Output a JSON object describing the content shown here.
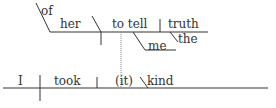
{
  "diagram": {
    "type": "sentence-diagram",
    "sentence": "I took (it) kind of her to tell me the truth",
    "line_color": "#333333",
    "main_clause": {
      "subject": "I",
      "verb": "took",
      "object": "(it)",
      "complement": "kind"
    },
    "modifier_phrase": {
      "preposition": "of",
      "object": "her",
      "infinitive": "to tell",
      "direct_object": "truth",
      "article": "the",
      "indirect_object": "me"
    }
  }
}
